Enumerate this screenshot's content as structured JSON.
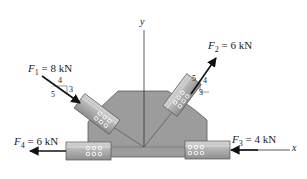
{
  "diagram": {
    "type": "free-body force diagram on gusset plate",
    "axes": {
      "x_label": "x",
      "y_label": "y"
    },
    "forces": [
      {
        "id": "F1",
        "symbol": "F",
        "subscript": "1",
        "value": "8 kN",
        "slope": {
          "run": "4",
          "rise": "3",
          "hyp": "5"
        },
        "direction": "down-right toward plate"
      },
      {
        "id": "F2",
        "symbol": "F",
        "subscript": "2",
        "value": "6 kN",
        "slope": {
          "run": "3",
          "rise": "4",
          "hyp": "5"
        },
        "direction": "up-right away from plate"
      },
      {
        "id": "F3",
        "symbol": "F",
        "subscript": "3",
        "value": "4 kN",
        "direction": "left, along x axis toward plate"
      },
      {
        "id": "F4",
        "symbol": "F",
        "subscript": "4",
        "value": "6 kN",
        "direction": "left, away from plate"
      }
    ],
    "colors": {
      "plate": "#9a9a9a",
      "plate_edge": "#555555",
      "member": "#b8b8b8",
      "member_dark": "#8c8c8c",
      "arrow": "#111111",
      "axis": "#333333"
    }
  },
  "labels": {
    "eq": " = ",
    "f1_value": "8 kN",
    "f2_value": "6 kN",
    "f3_value": "4 kN",
    "f4_value": "6 kN",
    "f1_sub": "1",
    "f2_sub": "2",
    "f3_sub": "3",
    "f4_sub": "4",
    "F": "F",
    "s4": "4",
    "s3": "3",
    "s5": "5",
    "x": "x",
    "y": "y"
  }
}
